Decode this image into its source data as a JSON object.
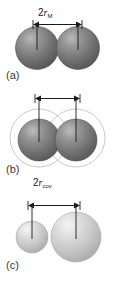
{
  "figure": {
    "background_color": "#ffffff",
    "panels": [
      {
        "id": "a",
        "label": "(a)",
        "dimension": {
          "prefix": "2",
          "symbol": "r",
          "subscript": "M",
          "meaning": "metallic-radius"
        },
        "spheres": [
          {
            "name": "left-sphere",
            "shade": "dark",
            "fill": "#6e6e6e"
          },
          {
            "name": "right-sphere",
            "shade": "dark",
            "fill": "#6e6e6e"
          }
        ],
        "outer_circles": false
      },
      {
        "id": "b",
        "label": "(b)",
        "dimension": {
          "prefix": "2",
          "symbol": "r",
          "subscript": "cov",
          "meaning": "covalent-radius"
        },
        "spheres": [
          {
            "name": "left-sphere",
            "shade": "dark",
            "fill": "#6e6e6e"
          },
          {
            "name": "right-sphere",
            "shade": "dark",
            "fill": "#6e6e6e"
          }
        ],
        "outer_circles": true
      },
      {
        "id": "c",
        "label": "(c)",
        "dimension": {
          "prefix": "",
          "symbol_left": "r",
          "subscript_left": "A",
          "operator": "+",
          "symbol_right": "r",
          "subscript_right": "B",
          "meaning": "sum-of-radii"
        },
        "spheres": [
          {
            "name": "small-sphere",
            "shade": "light",
            "fill": "#c8c8c8"
          },
          {
            "name": "large-sphere",
            "shade": "light",
            "fill": "#c8c8c8"
          }
        ],
        "outer_circles": false
      }
    ],
    "colors": {
      "sphere_dark": "#6e6e6e",
      "sphere_dark_highlight": "#b4b4b4",
      "sphere_dark_edge": "#4a4a4a",
      "sphere_light": "#c8c8c8",
      "sphere_light_highlight": "#f2f2f2",
      "sphere_light_edge": "#a8a8a8",
      "outline": "#b0b0b0",
      "arrow": "#1a1a1a",
      "text": "#3a3a3a"
    }
  }
}
